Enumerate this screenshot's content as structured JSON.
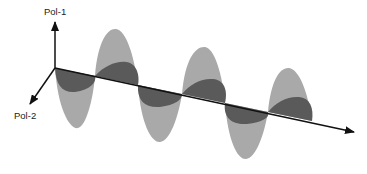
{
  "diagram": {
    "type": "electromagnetic-wave-polarization",
    "labels": {
      "pol1": "Pol-1",
      "pol2": "Pol-2"
    },
    "colors": {
      "background": "#ffffff",
      "pol1_wave": "#a9a9a9",
      "pol2_wave": "#5a5a5a",
      "axis": "#111111"
    },
    "axes": {
      "origin": [
        55,
        68
      ],
      "propagation_end": [
        355,
        132
      ],
      "pol1_end": [
        55,
        22
      ],
      "pol2_end": [
        30,
        104
      ]
    }
  }
}
